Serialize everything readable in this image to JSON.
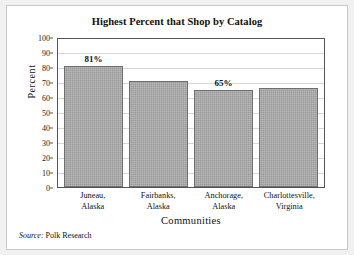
{
  "chart_data": {
    "type": "bar",
    "title": "Highest Percent that Shop by Catalog",
    "xlabel": "Communities",
    "ylabel": "Percent",
    "ylim": [
      0,
      100
    ],
    "ytick_step": 10,
    "yticks": [
      "100",
      "90",
      "80",
      "70",
      "60",
      "50",
      "40",
      "30",
      "20",
      "10",
      "0"
    ],
    "grid": true,
    "legend": null,
    "categories": [
      "Juneau, Alaska",
      "Fairbanks, Alaska",
      "Anchorage, Alaska",
      "Charlottesville, Virginia"
    ],
    "category_lines": [
      {
        "line1": "Juneau,",
        "line2": "Alaska"
      },
      {
        "line1": "Fairbanks,",
        "line2": "Alaska"
      },
      {
        "line1": "Anchorage,",
        "line2": "Alaska"
      },
      {
        "line1": "Charlottesville,",
        "line2": "Virginia"
      }
    ],
    "values": [
      81,
      71,
      65,
      66
    ],
    "data_labels": [
      "81%",
      "",
      "65%",
      ""
    ],
    "bar_color": "#9a9a9a",
    "bar_border_color": "#6f6f6f"
  },
  "source": {
    "label": "Source:",
    "text": "Polk Research"
  }
}
